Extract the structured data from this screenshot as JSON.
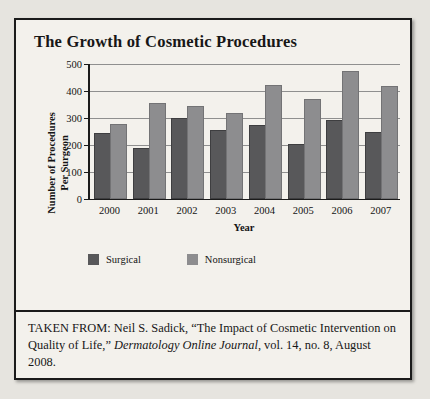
{
  "figure": {
    "title": "The Growth of Cosmetic Procedures",
    "caption_prefix": "TAKEN FROM: Neil S. Sadick, “The Impact of Cosmetic Intervention on Quality of Life,” ",
    "caption_italic": "Dermatology Online Journal",
    "caption_suffix": ", vol. 14, no. 8, August 2008."
  },
  "chart_data": {
    "type": "bar",
    "title": "The Growth of Cosmetic Procedures",
    "xlabel": "Year",
    "ylabel": "Number of Procedures Per Surgeon",
    "ylabel_line1": "Number of Procedures",
    "ylabel_line2": "Per Surgeon",
    "categories": [
      "2000",
      "2001",
      "2002",
      "2003",
      "2004",
      "2005",
      "2006",
      "2007"
    ],
    "series": [
      {
        "name": "Surgical",
        "color": "#58585a",
        "values": [
          237,
          180,
          293,
          248,
          265,
          195,
          285,
          240
        ]
      },
      {
        "name": "Nonsurgical",
        "color": "#8d8d8f",
        "values": [
          268,
          348,
          338,
          312,
          415,
          363,
          465,
          410
        ]
      }
    ],
    "ylim": [
      0,
      500
    ],
    "yticks": [
      0,
      100,
      200,
      300,
      400,
      500
    ],
    "grid": true,
    "legend_position": "bottom"
  }
}
